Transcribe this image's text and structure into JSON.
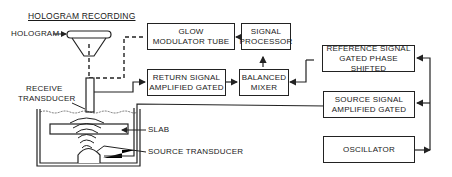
{
  "diagram": {
    "title": "HOLOGRAM RECORDING",
    "labels": {
      "hologram": "HOLOGRAM",
      "receive_transducer_1": "RECEIVE",
      "receive_transducer_2": "TRANSDUCER",
      "slab": "SLAB",
      "source_transducer": "SOURCE TRANSDUCER"
    },
    "blocks": {
      "glow_modulator": {
        "line1": "GLOW",
        "line2": "MODULATOR TUBE"
      },
      "signal_processor": {
        "line1": "SIGNAL",
        "line2": "PROCESSOR"
      },
      "return_signal": {
        "line1": "RETURN SIGNAL",
        "line2": "AMPLIFIED GATED"
      },
      "balanced_mixer": {
        "line1": "BALANCED",
        "line2": "MIXER"
      },
      "reference_signal": {
        "line1": "REFERENCE SIGNAL",
        "line2": "GATED PHASE SHIFTED"
      },
      "source_signal": {
        "line1": "SOURCE SIGNAL",
        "line2": "AMPLIFIED GATED"
      },
      "oscillator": {
        "line1": "OSCILLATOR"
      }
    },
    "colors": {
      "line": "#222222",
      "background": "#ffffff"
    }
  }
}
